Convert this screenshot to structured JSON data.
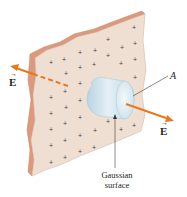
{
  "diagram": {
    "labels": {
      "field_left": "E",
      "field_right": "E",
      "area": "A",
      "gaussian_line1": "Gaussian",
      "gaussian_line2": "surface"
    },
    "vector_arrow_glyph": "→",
    "charge_symbol": "+",
    "colors": {
      "plate_face": "#efdfd2",
      "plate_edge": "#d99a7d",
      "charge": "#4a4040",
      "field_arrow": "#e8781e",
      "cylinder": "#cfe3ee",
      "cylinder_end": "#e6f1f7",
      "leader_line": "#3a3a3a",
      "text": "#231f20"
    }
  }
}
